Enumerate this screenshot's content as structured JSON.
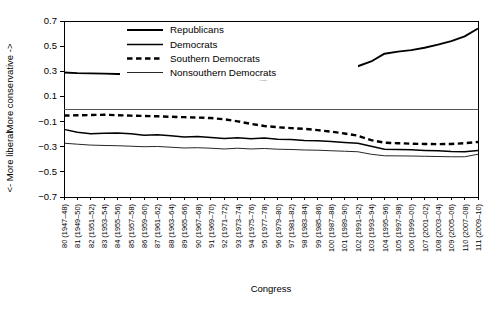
{
  "chart_data": {
    "type": "line",
    "title": "",
    "xlabel": "Congress",
    "ylabel_top": "More conservative ->",
    "ylabel_bottom": "<- More liberal",
    "ylim": [
      -0.7,
      0.7
    ],
    "yticks": [
      0.7,
      0.5,
      0.3,
      0.1,
      -0.1,
      -0.3,
      -0.5,
      -0.7
    ],
    "ytick_labels": [
      "0.7",
      "0.5",
      "0.3",
      "0.1",
      "-0.1",
      "-0.3",
      "-0.5",
      "-0.7"
    ],
    "grid": false,
    "zero_line": true,
    "legend_position": "top-center",
    "categories": [
      "80 (1947-48)",
      "81 (1949-50)",
      "82 (1951-52)",
      "83 (1953-54)",
      "84 (1955-56)",
      "85 (1957-58)",
      "86 (1959-60)",
      "87 (1961-62)",
      "88 (1963-64)",
      "89 (1965-66)",
      "90 (1967-68)",
      "91 (1969-70)",
      "92 (1971-72)",
      "93 (1973-74)",
      "94 (1975-76)",
      "95 (1977-78)",
      "96 (1979-80)",
      "97 (1981-82)",
      "98 (1983-84)",
      "99 (1985-86)",
      "100 (1987-88)",
      "101 (1989-90)",
      "102 (1991-92)",
      "103 (1993-94)",
      "104 (1995-96)",
      "105 (1997-98)",
      "106 (1999-00)",
      "107 (2001-02)",
      "108 (2003-04)",
      "109 (2005-06)",
      "110 (2007-08)",
      "111 (2009-10)"
    ],
    "x": [
      80,
      81,
      82,
      83,
      84,
      85,
      86,
      87,
      88,
      89,
      90,
      91,
      92,
      93,
      94,
      95,
      96,
      97,
      98,
      99,
      100,
      101,
      102,
      103,
      104,
      105,
      106,
      107,
      108,
      109,
      110,
      111
    ],
    "series": [
      {
        "name": "Republicans",
        "style": "solid-thick",
        "values": [
          0.29,
          0.285,
          0.283,
          0.281,
          0.279,
          0.277,
          0.272,
          0.268,
          0.266,
          0.268,
          0.265,
          0.262,
          0.252,
          0.247,
          0.241,
          0.236,
          0.243,
          0.259,
          0.262,
          0.282,
          0.3,
          0.325,
          0.34,
          0.378,
          0.44,
          0.456,
          0.468,
          0.487,
          0.512,
          0.54,
          0.578,
          0.64
        ]
      },
      {
        "name": "Democrats",
        "style": "solid-medium",
        "values": [
          -0.162,
          -0.185,
          -0.197,
          -0.192,
          -0.19,
          -0.196,
          -0.208,
          -0.205,
          -0.213,
          -0.222,
          -0.218,
          -0.226,
          -0.235,
          -0.228,
          -0.236,
          -0.23,
          -0.24,
          -0.243,
          -0.25,
          -0.252,
          -0.258,
          -0.266,
          -0.272,
          -0.297,
          -0.32,
          -0.322,
          -0.325,
          -0.33,
          -0.333,
          -0.338,
          -0.34,
          -0.33
        ]
      },
      {
        "name": "Southern Democrats",
        "style": "dashed-thick",
        "values": [
          -0.052,
          -0.05,
          -0.048,
          -0.046,
          -0.049,
          -0.053,
          -0.055,
          -0.058,
          -0.062,
          -0.065,
          -0.068,
          -0.072,
          -0.082,
          -0.098,
          -0.118,
          -0.135,
          -0.145,
          -0.152,
          -0.158,
          -0.168,
          -0.18,
          -0.195,
          -0.212,
          -0.248,
          -0.268,
          -0.272,
          -0.276,
          -0.278,
          -0.28,
          -0.278,
          -0.272,
          -0.262
        ]
      },
      {
        "name": "Nonsouthern Democrats",
        "style": "solid-thin",
        "values": [
          -0.272,
          -0.28,
          -0.287,
          -0.29,
          -0.292,
          -0.296,
          -0.3,
          -0.298,
          -0.304,
          -0.31,
          -0.308,
          -0.312,
          -0.318,
          -0.312,
          -0.318,
          -0.314,
          -0.32,
          -0.322,
          -0.326,
          -0.328,
          -0.332,
          -0.336,
          -0.34,
          -0.36,
          -0.372,
          -0.373,
          -0.374,
          -0.376,
          -0.378,
          -0.38,
          -0.38,
          -0.36
        ]
      }
    ]
  },
  "legend": {
    "items": [
      {
        "label": "Republicans",
        "style": "solid-thick"
      },
      {
        "label": "Democrats",
        "style": "solid-medium"
      },
      {
        "label": "Southern Democrats",
        "style": "dashed-thick"
      },
      {
        "label": "Nonsouthern Democrats",
        "style": "solid-thin"
      }
    ]
  }
}
